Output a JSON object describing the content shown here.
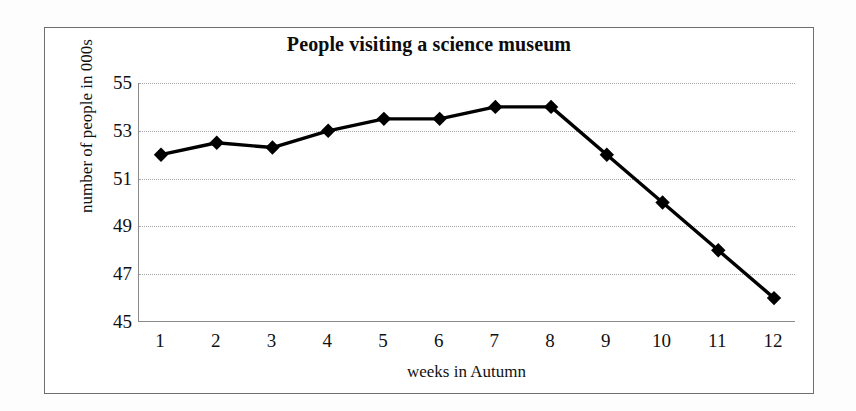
{
  "chart_data": {
    "type": "line",
    "title": "People visiting a science museum",
    "xlabel": "weeks in Autumn",
    "ylabel": "number of people in 000s",
    "categories": [
      "1",
      "2",
      "3",
      "4",
      "5",
      "6",
      "7",
      "8",
      "9",
      "10",
      "11",
      "12"
    ],
    "x": [
      1,
      2,
      3,
      4,
      5,
      6,
      7,
      8,
      9,
      10,
      11,
      12
    ],
    "values": [
      52,
      52.5,
      52.3,
      53,
      53.5,
      53.5,
      54,
      54,
      52,
      50,
      48,
      46
    ],
    "series": [
      {
        "name": "people visiting",
        "values": [
          52,
          52.5,
          52.3,
          53,
          53.5,
          53.5,
          54,
          54,
          52,
          50,
          48,
          46
        ]
      }
    ],
    "ylim": [
      45,
      55
    ],
    "xlim": [
      1,
      12
    ],
    "yticks": [
      55,
      53,
      51,
      49,
      47,
      45
    ],
    "ytick_labels": [
      "55",
      "53",
      "51",
      "49",
      "47",
      "45"
    ],
    "xticks": [
      1,
      2,
      3,
      4,
      5,
      6,
      7,
      8,
      9,
      10,
      11,
      12
    ],
    "grid": "horizontal-dotted",
    "legend": "none",
    "marker": "diamond",
    "line_color": "#000000",
    "marker_color": "#000000",
    "grid_color": "#a8a8a8",
    "frame_color": "#6f6f6f"
  }
}
